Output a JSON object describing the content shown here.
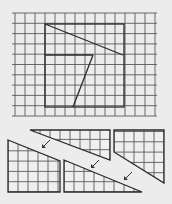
{
  "colors": {
    "background": "#ececec",
    "grid": "#5a5a5a",
    "outline": "#2a2a2a"
  },
  "top_figure": {
    "grid": {
      "x0": 15,
      "x1": 155,
      "y0": 13,
      "y1": 116,
      "step_x": 10,
      "step_y": 10.3
    },
    "square": {
      "x": 45,
      "y": 24,
      "w": 79,
      "h": 83
    },
    "cut_lines": [
      {
        "x1": 45,
        "y1": 24,
        "x2": 123,
        "y2": 55
      },
      {
        "x1": 45,
        "y1": 55,
        "x2": 93,
        "y2": 55
      },
      {
        "x1": 93,
        "y1": 55,
        "x2": 73,
        "y2": 107
      }
    ]
  },
  "bottom_pieces": [
    {
      "name": "piece-top-middle",
      "points": [
        [
          30,
          130
        ],
        [
          110,
          130
        ],
        [
          110,
          160
        ]
      ],
      "grid_step": 10
    },
    {
      "name": "piece-top-right",
      "points": [
        [
          114,
          130
        ],
        [
          164,
          130
        ],
        [
          164,
          183
        ],
        [
          114,
          152
        ]
      ],
      "grid_step": 10
    },
    {
      "name": "piece-left",
      "points": [
        [
          8,
          140
        ],
        [
          60,
          161
        ],
        [
          60,
          192
        ],
        [
          8,
          192
        ]
      ],
      "grid_step": 10
    },
    {
      "name": "piece-bottom-middle",
      "points": [
        [
          64,
          160
        ],
        [
          142,
          192
        ],
        [
          64,
          192
        ]
      ],
      "grid_step": 10
    }
  ],
  "arrows": [
    {
      "x1": 50,
      "y1": 140,
      "x2": 42,
      "y2": 148
    },
    {
      "x1": 99,
      "y1": 160,
      "x2": 91,
      "y2": 168
    },
    {
      "x1": 132,
      "y1": 172,
      "x2": 124,
      "y2": 180
    }
  ]
}
